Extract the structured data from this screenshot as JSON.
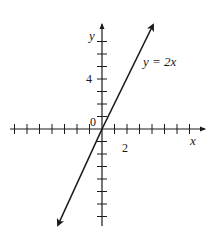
{
  "chart_data": {
    "type": "line",
    "title": "",
    "equation_label": "y = 2x",
    "xlabel": "x",
    "ylabel": "y",
    "origin_label": "0",
    "xlim": [
      -7.5,
      8.2
    ],
    "ylim": [
      -7.8,
      8.2
    ],
    "x_tick_step": 1,
    "y_tick_step": 1,
    "labeled_ticks": {
      "x": [
        "2"
      ],
      "y": [
        "4"
      ]
    },
    "grid": false,
    "series": [
      {
        "name": "y = 2x",
        "slope": 2,
        "intercept": 0,
        "x": [
          -3.6,
          4.2
        ],
        "y": [
          -7.8,
          8.4
        ]
      }
    ],
    "colors": {
      "axis": "#1a1a1a",
      "line": "#1a1a1a"
    }
  }
}
